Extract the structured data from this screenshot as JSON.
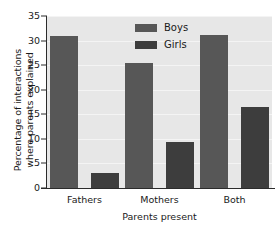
{
  "chart_data": {
    "type": "bar",
    "title": "",
    "subtitle": "",
    "xlabel": "Parents present",
    "ylabel_lines": [
      "Percentage of interactions",
      "where parents explained"
    ],
    "ylabel": "Percentage of interactions where parents explained",
    "categories": [
      "Fathers",
      "Mothers",
      "Both"
    ],
    "series": [
      {
        "name": "Boys",
        "values": [
          31.0,
          25.5,
          31.1
        ],
        "color": "#575757"
      },
      {
        "name": "Girls",
        "values": [
          3.0,
          9.4,
          16.4
        ],
        "color": "#3d3d3d"
      }
    ],
    "ylim": [
      0,
      35
    ],
    "ytick_values": [
      0,
      5,
      10,
      15,
      20,
      25,
      30,
      35
    ],
    "ytick_labels": [
      "0",
      "5",
      "10",
      "15",
      "20",
      "25",
      "30",
      "35"
    ],
    "grid": true,
    "grid_color": "#f4f4f4",
    "grid_axis": "y",
    "legend_entries": [
      "Boys",
      "Girls"
    ],
    "legend_position": "upper center",
    "plot_background": "#e7e7e7",
    "figure_background": "#ffffff",
    "axis_color": "#2b2b2b",
    "text_color": "#1a1a1a"
  }
}
